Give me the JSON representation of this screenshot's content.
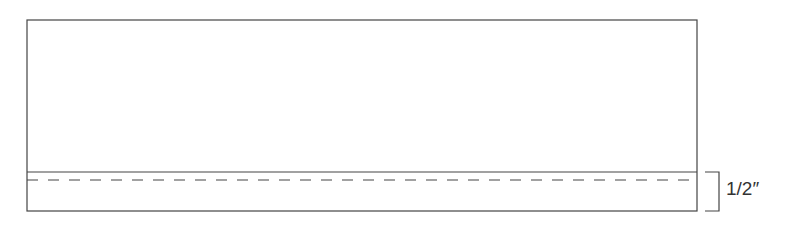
{
  "diagram": {
    "type": "fabric hem diagram",
    "hem_label": "1/2″",
    "colors": {
      "line": "#444444",
      "background": "#ffffff"
    }
  }
}
